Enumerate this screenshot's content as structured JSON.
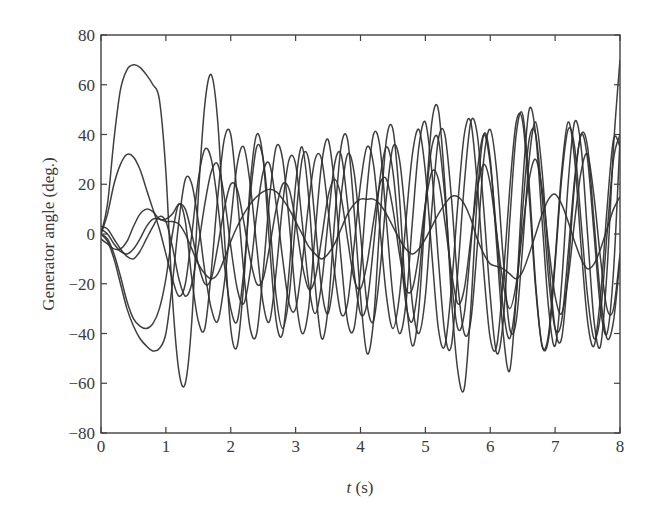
{
  "chart_data": {
    "type": "line",
    "title": "",
    "xlabel": "t (s)",
    "xlabel_italic_part": "t",
    "xlabel_rest": " (s)",
    "ylabel": "Generator angle (deg.)",
    "xlim": [
      0,
      8
    ],
    "ylim": [
      -80,
      80
    ],
    "xticks": [
      0,
      1,
      2,
      3,
      4,
      5,
      6,
      7,
      8
    ],
    "xtick_labels": [
      "0",
      "1",
      "2",
      "3",
      "4",
      "5",
      "6",
      "7",
      "8"
    ],
    "yticks": [
      80,
      60,
      40,
      20,
      0,
      -20,
      -40,
      -60,
      -80
    ],
    "ytick_labels": [
      "80",
      "60",
      "40",
      "20",
      "0",
      "−20",
      "−40",
      "−60",
      "−80"
    ],
    "grid": false,
    "legend": null,
    "line_color": "#2f2f2f",
    "x_step": 0.1,
    "x": [
      0,
      0.1,
      0.2,
      0.3,
      0.4,
      0.5,
      0.6,
      0.7,
      0.8,
      0.9,
      1,
      1.1,
      1.2,
      1.3,
      1.4,
      1.5,
      1.6,
      1.7,
      1.8,
      1.9,
      2,
      2.1,
      2.2,
      2.3,
      2.4,
      2.5,
      2.6,
      2.7,
      2.8,
      2.9,
      3,
      3.1,
      3.2,
      3.3,
      3.4,
      3.5,
      3.6,
      3.7,
      3.8,
      3.9,
      4,
      4.1,
      4.2,
      4.3,
      4.4,
      4.5,
      4.6,
      4.7,
      4.8,
      4.9,
      5,
      5.1,
      5.2,
      5.3,
      5.4,
      5.5,
      5.6,
      5.7,
      5.8,
      5.9,
      6,
      6.1,
      6.2,
      6.3,
      6.4,
      6.5,
      6.6,
      6.7,
      6.8,
      6.9,
      7,
      7.1,
      7.2,
      7.3,
      7.4,
      7.5,
      7.6,
      7.7,
      7.8,
      7.9,
      8
    ],
    "series": [
      {
        "name": "generator-1",
        "values": [
          0,
          12,
          38,
          58,
          66,
          68,
          67,
          64,
          60,
          54,
          25,
          -25,
          -55,
          -60,
          -35,
          15,
          52,
          64,
          45,
          0,
          -38,
          -45,
          -20,
          20,
          40,
          30,
          -5,
          -35,
          -40,
          -15,
          20,
          35,
          15,
          -20,
          -42,
          -30,
          5,
          35,
          38,
          10,
          -25,
          -48,
          -35,
          5,
          38,
          42,
          15,
          -25,
          -45,
          -30,
          10,
          45,
          50,
          20,
          -25,
          -55,
          -62,
          -30,
          15,
          40,
          30,
          -5,
          -40,
          -55,
          -25,
          20,
          50,
          40,
          5,
          -30,
          -45,
          -20,
          20,
          45,
          35,
          0,
          -35,
          -45,
          -15,
          35,
          70
        ]
      },
      {
        "name": "generator-2",
        "values": [
          0,
          8,
          20,
          28,
          32,
          31,
          26,
          18,
          10,
          2,
          -8,
          -18,
          -25,
          -20,
          0,
          22,
          34,
          30,
          12,
          -12,
          -30,
          -35,
          -15,
          15,
          35,
          30,
          5,
          -25,
          -38,
          -25,
          5,
          30,
          30,
          5,
          -22,
          -32,
          -15,
          15,
          32,
          25,
          0,
          -28,
          -35,
          -15,
          15,
          35,
          30,
          5,
          -28,
          -40,
          -25,
          10,
          38,
          40,
          15,
          -20,
          -40,
          -35,
          -5,
          30,
          42,
          25,
          -10,
          -38,
          -35,
          -5,
          30,
          45,
          25,
          -10,
          -38,
          -42,
          -15,
          20,
          40,
          30,
          0,
          -30,
          -40,
          -15,
          38
        ]
      },
      {
        "name": "generator-3",
        "values": [
          0,
          -3,
          -10,
          -20,
          -30,
          -37,
          -42,
          -45,
          -47,
          -46,
          -40,
          -20,
          5,
          22,
          20,
          5,
          -15,
          -30,
          -35,
          -20,
          5,
          28,
          35,
          20,
          -5,
          -28,
          -35,
          -15,
          12,
          30,
          28,
          5,
          -20,
          -32,
          -20,
          5,
          28,
          32,
          12,
          -15,
          -32,
          -28,
          -5,
          22,
          35,
          25,
          -2,
          -28,
          -35,
          -18,
          12,
          35,
          38,
          15,
          -18,
          -38,
          -32,
          -5,
          25,
          40,
          28,
          0,
          -30,
          -42,
          -25,
          10,
          38,
          40,
          15,
          -18,
          -38,
          -35,
          -8,
          22,
          40,
          35,
          5,
          -25,
          -42,
          -35,
          -10
        ]
      },
      {
        "name": "generator-4",
        "values": [
          0,
          -2,
          -8,
          -17,
          -27,
          -34,
          -37,
          -38,
          -36,
          -30,
          -18,
          0,
          12,
          5,
          -18,
          -35,
          -38,
          -15,
          15,
          38,
          40,
          15,
          -15,
          -38,
          -40,
          -15,
          15,
          35,
          30,
          5,
          -25,
          -40,
          -30,
          0,
          28,
          38,
          20,
          -10,
          -35,
          -38,
          -15,
          18,
          40,
          35,
          5,
          -25,
          -40,
          -28,
          5,
          35,
          45,
          25,
          -10,
          -40,
          -45,
          -15,
          20,
          45,
          40,
          10,
          -25,
          -48,
          -35,
          5,
          40,
          48,
          20,
          -20,
          -45,
          -40,
          -10,
          25,
          45,
          30,
          -5,
          -35,
          -45,
          -25,
          10,
          38,
          35
        ]
      },
      {
        "name": "generator-5",
        "values": [
          2,
          0,
          -4,
          -7,
          -8,
          -6,
          -2,
          3,
          6,
          6,
          5,
          5,
          4,
          0,
          -6,
          -12,
          -16,
          -18,
          -16,
          -10,
          -3,
          3,
          8,
          12,
          15,
          17,
          18,
          17,
          14,
          10,
          5,
          0,
          -5,
          -8,
          -10,
          -8,
          -4,
          2,
          8,
          12,
          14,
          14,
          14,
          12,
          8,
          3,
          -2,
          -6,
          -8,
          -6,
          -2,
          3,
          8,
          12,
          15,
          15,
          12,
          6,
          -2,
          -8,
          -12,
          -13,
          -14,
          -16,
          -18,
          -15,
          -8,
          0,
          8,
          14,
          16,
          12,
          5,
          -3,
          -10,
          -14,
          -12,
          -6,
          2,
          10,
          15
        ]
      },
      {
        "name": "generator-6",
        "values": [
          -2,
          -4,
          -6,
          -6,
          -3,
          3,
          8,
          10,
          9,
          6,
          6,
          8,
          12,
          10,
          0,
          -12,
          -20,
          -18,
          -5,
          10,
          20,
          18,
          5,
          -10,
          -20,
          -18,
          -5,
          10,
          20,
          18,
          5,
          -12,
          -22,
          -18,
          -2,
          15,
          22,
          15,
          -2,
          -18,
          -22,
          -12,
          5,
          20,
          22,
          10,
          -8,
          -22,
          -22,
          -8,
          12,
          25,
          22,
          5,
          -15,
          -28,
          -22,
          -2,
          18,
          28,
          20,
          0,
          -20,
          -30,
          -20,
          2,
          22,
          30,
          18,
          -5,
          -25,
          -32,
          -18,
          5,
          25,
          32,
          15,
          -10,
          -30,
          -30,
          -8
        ]
      },
      {
        "name": "generator-7",
        "values": [
          3,
          2,
          -2,
          -6,
          -9,
          -10,
          -7,
          -2,
          3,
          7,
          5,
          -5,
          -18,
          -25,
          -20,
          -5,
          12,
          25,
          28,
          15,
          -5,
          -22,
          -28,
          -15,
          8,
          25,
          28,
          12,
          -10,
          -28,
          -30,
          -12,
          12,
          30,
          30,
          10,
          -15,
          -32,
          -28,
          -5,
          20,
          35,
          28,
          2,
          -25,
          -38,
          -25,
          5,
          32,
          42,
          25,
          -8,
          -38,
          -45,
          -22,
          12,
          40,
          45,
          20,
          -15,
          -42,
          -45,
          -18,
          18,
          45,
          45,
          15,
          -22,
          -45,
          -42,
          -12,
          22,
          42,
          35,
          5,
          -25,
          -42,
          -32,
          0,
          30,
          40
        ]
      }
    ]
  }
}
